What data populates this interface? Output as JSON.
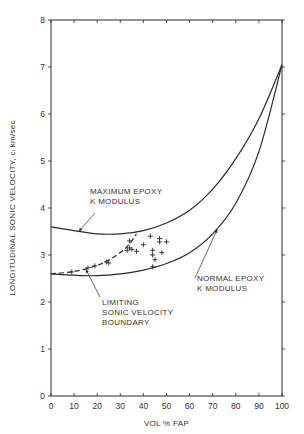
{
  "chart_data": {
    "type": "line",
    "title": "",
    "xlabel": "VOL % FAP",
    "ylabel": "LONGITUDINAL SONIC VELOCITY,  cₗ km/sec",
    "xlim": [
      0,
      100
    ],
    "ylim": [
      0,
      8
    ],
    "x_ticks": [
      0,
      10,
      20,
      30,
      40,
      50,
      60,
      70,
      80,
      90,
      100
    ],
    "y_ticks": [
      0,
      1,
      2,
      3,
      4,
      5,
      6,
      7,
      8
    ],
    "grid": false,
    "legend": null,
    "series": [
      {
        "name": "MAXIMUM EPOXY K MODULUS",
        "style": "solid",
        "x": [
          0,
          10,
          20,
          30,
          40,
          50,
          60,
          70,
          80,
          90,
          100
        ],
        "y": [
          3.6,
          3.52,
          3.45,
          3.45,
          3.52,
          3.68,
          3.95,
          4.4,
          5.05,
          5.9,
          7.05
        ]
      },
      {
        "name": "NORMAL EPOXY K MODULUS",
        "style": "solid",
        "x": [
          0,
          10,
          20,
          30,
          40,
          50,
          60,
          70,
          80,
          90,
          100
        ],
        "y": [
          2.6,
          2.57,
          2.56,
          2.6,
          2.68,
          2.82,
          3.05,
          3.45,
          4.1,
          5.2,
          7.05
        ]
      },
      {
        "name": "LIMITING SONIC VELOCITY BOUNDARY",
        "style": "dashed",
        "x": [
          0,
          10,
          20,
          27,
          33,
          37
        ],
        "y": [
          2.6,
          2.65,
          2.78,
          2.95,
          3.18,
          3.45
        ]
      },
      {
        "name": "Measured data",
        "style": "markers-plus",
        "points": [
          [
            9,
            2.64
          ],
          [
            16,
            2.73
          ],
          [
            19,
            2.77
          ],
          [
            24,
            2.85
          ],
          [
            25,
            2.83
          ],
          [
            33,
            3.1
          ],
          [
            34,
            3.3
          ],
          [
            34,
            3.15
          ],
          [
            35,
            3.12
          ],
          [
            37,
            3.08
          ],
          [
            40,
            3.22
          ],
          [
            43,
            3.4
          ],
          [
            44,
            3.1
          ],
          [
            44,
            3.0
          ],
          [
            44,
            2.75
          ],
          [
            45,
            2.9
          ],
          [
            47,
            3.35
          ],
          [
            47,
            3.28
          ],
          [
            48,
            3.05
          ],
          [
            50,
            3.28
          ]
        ]
      }
    ],
    "annotations": [
      {
        "text": [
          "MAXIMUM EPOXY",
          "K MODULUS"
        ],
        "points_to": [
          12,
          3.5
        ]
      },
      {
        "text": [
          "NORMAL EPOXY",
          "K MODULUS"
        ],
        "points_to": [
          72,
          3.55
        ]
      },
      {
        "text": [
          "LIMITING",
          "SONIC VELOCITY",
          "BOUNDARY"
        ],
        "points_to": [
          15,
          2.7
        ]
      }
    ]
  },
  "layout": {
    "plot_left": 51,
    "plot_right": 282,
    "plot_top": 20,
    "plot_bottom": 396,
    "line_color": "#2a2a2a"
  }
}
